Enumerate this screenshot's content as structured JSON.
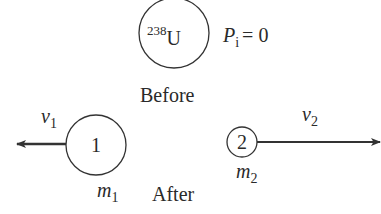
{
  "diagram": {
    "stroke_color": "#333333",
    "text_color": "#2a2a2a",
    "before": {
      "nucleus": {
        "mass_number": "238",
        "symbol": "U"
      },
      "momentum": {
        "symbol": "P",
        "subscript": "i",
        "equals": "= 0"
      },
      "label": "Before"
    },
    "after": {
      "label": "After",
      "fragment1": {
        "id_label": "1",
        "mass_symbol": "m",
        "mass_subscript": "1",
        "velocity_symbol": "v",
        "velocity_subscript": "1",
        "direction": "left"
      },
      "fragment2": {
        "id_label": "2",
        "mass_symbol": "m",
        "mass_subscript": "2",
        "velocity_symbol": "v",
        "velocity_subscript": "2",
        "direction": "right"
      }
    }
  }
}
